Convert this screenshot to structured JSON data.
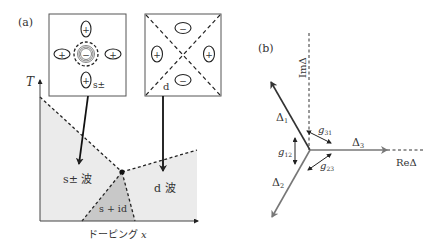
{
  "panel_a": {
    "label": "(a)",
    "y_axis_label": "T",
    "x_axis_label": "ドーピング",
    "x_axis_var": "x",
    "inset_spm": {
      "label": "s±",
      "lobes": [
        "+",
        "+",
        "+",
        "+"
      ],
      "center": "−"
    },
    "inset_d": {
      "label": "d",
      "lobes_vertical": [
        "−",
        "−"
      ],
      "lobes_horizontal": [
        "+",
        "+"
      ]
    },
    "regions": {
      "s_pm": "s± 波",
      "d": "d 波",
      "s_id": "s + id"
    },
    "colors": {
      "phase_fill": "#ebebeb",
      "s_id_fill": "#c8c8c8",
      "line": "#222222"
    }
  },
  "panel_b": {
    "label": "(b)",
    "im_axis": "ImΔ",
    "re_axis": "ReΔ",
    "vectors": [
      {
        "name": "Δ",
        "sub": "1",
        "color": "#333333"
      },
      {
        "name": "Δ",
        "sub": "2",
        "color": "#777777"
      },
      {
        "name": "Δ",
        "sub": "3",
        "color": "#777777"
      }
    ],
    "couplings": [
      {
        "name": "g",
        "sub": "31"
      },
      {
        "name": "g",
        "sub": "12"
      },
      {
        "name": "g",
        "sub": "23"
      }
    ]
  }
}
